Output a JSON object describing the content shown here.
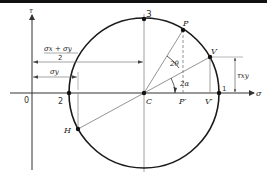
{
  "colors": {
    "circle": "#1a1a1a",
    "axis": "#333333",
    "guide": "#888888",
    "text": "#222222",
    "topbar": "#111111"
  },
  "axes": {
    "vertical_label": "τ",
    "horizontal_label": "σ",
    "origin_label": "0"
  },
  "points": {
    "top": "3",
    "left": "2",
    "right": "1",
    "center": "C",
    "p": "P",
    "p_proj": "P′",
    "v": "V",
    "v_proj": "V′",
    "h": "H"
  },
  "angles": {
    "two_theta": "2θ",
    "two_alpha": "2α"
  },
  "dimensions": {
    "mean_stress_numerator": "σx + σy",
    "mean_stress_denominator": "2",
    "sigma_y": "σy",
    "tau_xy": "τxy"
  },
  "geometry": {
    "center": [
      144,
      93
    ],
    "radius": 75,
    "P": [
      183,
      30
    ],
    "V": [
      210,
      57
    ],
    "H": [
      78,
      129
    ]
  }
}
